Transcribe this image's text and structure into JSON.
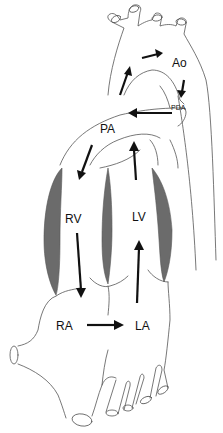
{
  "diagram": {
    "labels": {
      "ao": "Ao",
      "pda": "PDA",
      "pa": "PA",
      "rv": "RV",
      "lv": "LV",
      "ra": "RA",
      "la": "LA"
    },
    "colors": {
      "outline": "#555555",
      "wall": "#6b6b6b",
      "arrow": "#111111",
      "background": "#ffffff"
    },
    "flow_arrows": [
      {
        "from": "RA",
        "to": "LA",
        "direction": "right"
      },
      {
        "from": "RA",
        "to": "RV",
        "direction": "down-in-RV"
      },
      {
        "from": "LA",
        "to": "LV",
        "direction": "up-in-LV"
      },
      {
        "from": "LV",
        "to": "Ao",
        "direction": "up"
      },
      {
        "from": "Ao-arch",
        "to": "Ao",
        "direction": "right"
      },
      {
        "from": "Ao",
        "to": "PDA",
        "direction": "down"
      },
      {
        "from": "PDA",
        "to": "PA",
        "direction": "left"
      },
      {
        "from": "PA",
        "to": "RV",
        "direction": "down-left"
      }
    ]
  }
}
